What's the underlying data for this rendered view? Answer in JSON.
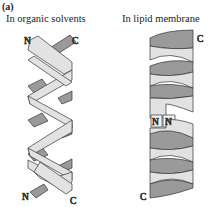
{
  "figure": {
    "panel_label": "(a)",
    "left": {
      "caption": "In organic solvents",
      "description": "double helix",
      "top_left_terminus": "N",
      "top_right_terminus": "C",
      "bottom_left_terminus": "N",
      "bottom_right_terminus": "C"
    },
    "right": {
      "caption": "In lipid membrane",
      "description": "two stacked single helices meeting head-to-head",
      "top_terminus": "C",
      "middle_left_terminus": "N",
      "middle_right_terminus": "N",
      "bottom_terminus": "C"
    },
    "colors": {
      "light_strand": "#e2e2e2",
      "dark_strand": "#9a9a9a",
      "outline": "#333333"
    }
  }
}
